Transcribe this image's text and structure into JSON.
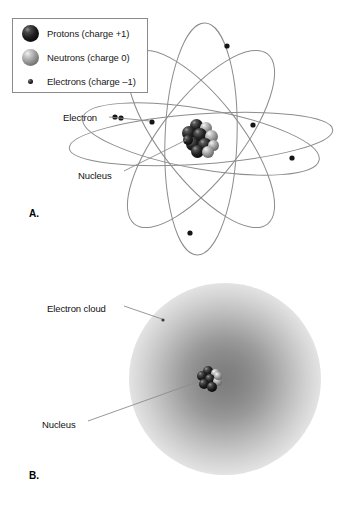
{
  "figure": {
    "panels": [
      {
        "letter": "A.",
        "model": "planetary orbital model"
      },
      {
        "letter": "B.",
        "model": "electron cloud model"
      }
    ]
  },
  "legend": {
    "items": [
      {
        "marker": "proton-sphere-icon",
        "label": "Protons (charge +1)"
      },
      {
        "marker": "neutron-sphere-icon",
        "label": "Neutrons (charge 0)"
      },
      {
        "marker": "electron-dot-icon",
        "label": "Electrons (charge –1)"
      }
    ]
  },
  "panel_a": {
    "letter": "A.",
    "labels": {
      "electron": "Electron",
      "nucleus": "Nucleus"
    }
  },
  "panel_b": {
    "letter": "B.",
    "labels": {
      "electron_cloud": "Electron cloud",
      "nucleus": "Nucleus"
    }
  },
  "colors": {
    "background": "#ffffff",
    "legend_border": "#8a8a8a",
    "orbit_line": "#8c8c8c",
    "leader_line": "#8c8c8c",
    "text": "#111111",
    "proton_dark": "#0a0a0a",
    "neutron_gray": "#9a9a9a",
    "cloud_core": "#7d7d7d"
  }
}
